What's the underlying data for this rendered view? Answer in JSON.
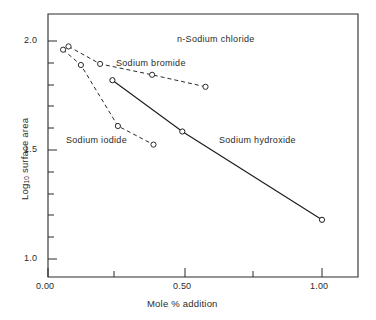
{
  "chart_data": {
    "type": "line",
    "title": "",
    "xlabel": "Mole % addition",
    "ylabel": "Log10 surface area",
    "ylabel_base": "Log",
    "ylabel_sub": "10",
    "ylabel_rest": " surface area",
    "xlim": [
      0.0,
      1.15
    ],
    "ylim": [
      0.93,
      2.07
    ],
    "xticks": [
      0.0,
      0.25,
      0.5,
      0.75,
      1.0
    ],
    "xticklabels": [
      "0.00",
      "",
      "0.50",
      "",
      "1.00"
    ],
    "yticks": [
      1.0,
      1.1,
      1.2,
      1.3,
      1.4,
      1.5,
      1.6,
      1.7,
      1.8,
      1.9,
      2.0
    ],
    "yticklabels": [
      "1.0",
      "",
      "",
      "",
      "",
      "1.5",
      "",
      "",
      "",
      "",
      "2.0"
    ],
    "grid": false,
    "legend": "inline-annotations",
    "marker": "open-circle",
    "series": [
      {
        "name": "n-Sodium chloride",
        "label": "n-Sodium chloride",
        "linestyle": "dashed",
        "color": "#2b2b2b",
        "x": [
          0.075,
          0.19,
          0.38,
          0.575
        ],
        "y": [
          1.975,
          1.895,
          1.845,
          1.79
        ]
      },
      {
        "name": "Sodium bromide",
        "label": "Sodium bromide",
        "linestyle": "dashed",
        "color": "#2b2b2b",
        "x": [
          0.055,
          0.12,
          0.255,
          0.385
        ],
        "y": [
          1.96,
          1.89,
          1.61,
          1.525
        ]
      },
      {
        "name": "Sodium hydroxide",
        "label": "Sodium hydroxide",
        "linestyle": "solid",
        "color": "#1a1a1a",
        "x": [
          0.235,
          0.49,
          1.0
        ],
        "y": [
          1.82,
          1.585,
          1.18
        ]
      }
    ],
    "annotations": [
      {
        "text": "n-Sodium chloride",
        "x": 0.47,
        "y": 2.0
      },
      {
        "text": "Sodium bromide",
        "x": 0.255,
        "y": 1.925
      },
      {
        "text": "Sodium iodide",
        "x": 0.055,
        "y": 1.585
      },
      {
        "text": "Sodium hydroxide",
        "x": 0.565,
        "y": 1.525
      }
    ],
    "series_label_iodide": "Sodium iodide"
  },
  "axes": {
    "x_title": "Mole % addition",
    "x_tick_0": "0.00",
    "x_tick_1": "0.50",
    "x_tick_2": "1.00",
    "y_tick_0": "1.0",
    "y_tick_1": "1.5",
    "y_tick_2": "2.0",
    "y_title_base": "Log",
    "y_title_sub": "10",
    "y_title_rest": " surface area"
  },
  "labels": {
    "sodium_chloride": "n-Sodium chloride",
    "sodium_bromide": "Sodium bromide",
    "sodium_iodide": "Sodium iodide",
    "sodium_hydroxide": "Sodium hydroxide"
  }
}
